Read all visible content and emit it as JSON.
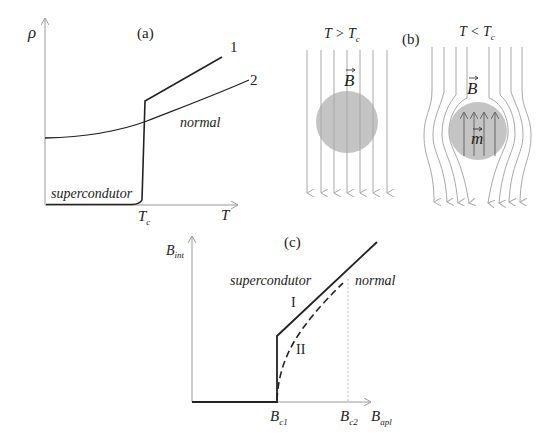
{
  "panel_a": {
    "tag": "(a)",
    "y_axis_label": "ρ",
    "x_axis_label": "T",
    "tc_label_main": "T",
    "tc_label_sub": "c",
    "curve1_label": "1",
    "curve2_label": "2",
    "normal_label": "normal",
    "super_label": "supercondutor"
  },
  "panel_b": {
    "tag": "(b)",
    "left_condition_main": "T > T",
    "left_condition_sub": "c",
    "right_condition_main": "T < T",
    "right_condition_sub": "c",
    "field_label": "B",
    "moment_label": "m"
  },
  "panel_c": {
    "tag": "(c)",
    "y_axis_label_main": "B",
    "y_axis_label_sub": "int",
    "x_axis_label_main": "B",
    "x_axis_label_sub": "apl",
    "bc1_main": "B",
    "bc1_sub": "c1",
    "bc2_main": "B",
    "bc2_sub": "c2",
    "super_label": "supercondutor",
    "normal_label": "normal",
    "type1_label": "I",
    "type2_label": "II"
  },
  "colors": {
    "curve": "#222222",
    "axis": "#9a9a9a",
    "field_line": "#a8a8a8",
    "sample": "#c4c4c4",
    "moment_arrow": "#666666"
  }
}
